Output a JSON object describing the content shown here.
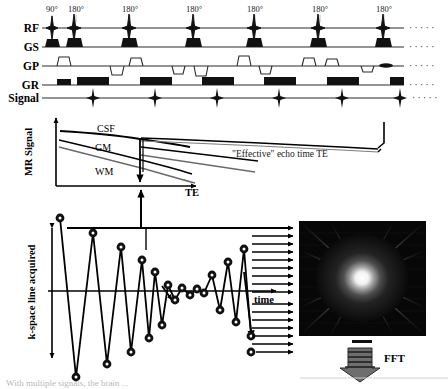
{
  "figure": {
    "sequence": {
      "row_labels": [
        "RF",
        "GS",
        "GP",
        "GR",
        "Signal"
      ],
      "pulse_labels": [
        "90°",
        "180°",
        "180°",
        "180°",
        "180°",
        "180°",
        "180°"
      ],
      "pulse_x": [
        52,
        74,
        129,
        193,
        254,
        318,
        383
      ],
      "continuation_marker": "· · · · ·",
      "rf_axis_y": 28,
      "gs_axis_y": 47,
      "gp_axis_y": 66,
      "gr_axis_y": 85,
      "signal_axis_y": 98,
      "echo_x": [
        74,
        107,
        139,
        171,
        203,
        235,
        267
      ],
      "signal_echo_x": [
        106,
        160,
        216,
        274,
        334,
        392
      ]
    },
    "signal_plot": {
      "ylabel": "MR Signal",
      "xlabel": "TE",
      "curves": [
        {
          "name": "CSF",
          "label": "CSF",
          "label_x": 110,
          "label_y": 133,
          "start_y": 131,
          "end_y": 155,
          "color": "#000000"
        },
        {
          "name": "GM",
          "label": "GM",
          "label_x": 106,
          "label_y": 150,
          "start_y": 140,
          "end_y": 178,
          "color": "#000000"
        },
        {
          "name": "WM",
          "label": "WM",
          "label_x": 106,
          "label_y": 172,
          "start_y": 146,
          "end_y": 184,
          "color": "#555555"
        }
      ],
      "annotation": "\"Effective\" echo time TE",
      "effective_te_x": 160,
      "origin": {
        "x": 56,
        "y": 186
      },
      "x_axis_end": 195
    },
    "kspace_plot": {
      "ylabel": "k-space line acquired",
      "xlabel": "time",
      "center_axis_y": 291,
      "origin_x": 52,
      "data_points_x": [
        60,
        76,
        93,
        107,
        121,
        131,
        142,
        149,
        155,
        162,
        168,
        175,
        182,
        190,
        197,
        204,
        212,
        220,
        228,
        236,
        244,
        251
      ],
      "data_points_y": [
        218,
        377,
        233,
        364,
        247,
        352,
        260,
        338,
        272,
        325,
        285,
        300,
        288,
        295,
        289,
        293,
        275,
        310,
        262,
        322,
        249,
        336
      ],
      "n_points": 22
    },
    "kspace_image": {
      "description": "k-space magnitude image, bright center with radial streaks",
      "x": 299,
      "y": 221,
      "width": 127,
      "height": 115,
      "bg_color": "#070707",
      "center_color": "#ffffff"
    },
    "fft": {
      "label": "FFT"
    },
    "caption": {
      "text": "With multiple signals, the brain ..."
    }
  }
}
